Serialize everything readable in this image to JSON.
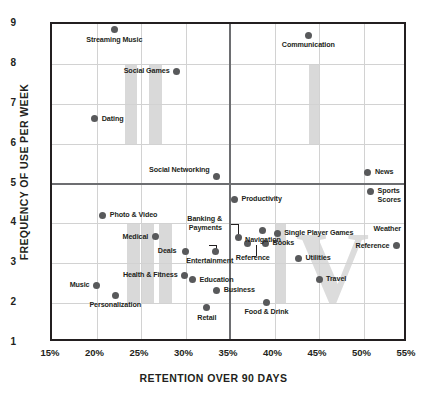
{
  "chart_data": {
    "type": "scatter",
    "title": "",
    "xlabel": "RETENTION OVER 90 DAYS",
    "ylabel": "FREQUENCY OF USE PER WEEK",
    "xlim": [
      15,
      55
    ],
    "ylim": [
      1,
      9
    ],
    "xticks": [
      "15%",
      "20%",
      "25%",
      "30%",
      "35%",
      "40%",
      "45%",
      "50%",
      "55%"
    ],
    "yticks": [
      "1",
      "2",
      "3",
      "4",
      "5",
      "6",
      "7",
      "8",
      "9"
    ],
    "grid": true,
    "legend": "none",
    "quadrant_divider_x": 35,
    "quadrant_divider_y": 5,
    "watermark": "IIII IV",
    "points": [
      {
        "label": "Streaming Music",
        "x": 22.0,
        "y": 8.85,
        "pos": "bc",
        "dx": 0,
        "dy": 6
      },
      {
        "label": "Social Games",
        "x": 29.0,
        "y": 7.82,
        "pos": "r",
        "dx": -7,
        "dy": 0
      },
      {
        "label": "Dating",
        "x": 19.8,
        "y": 6.62,
        "pos": "l",
        "dx": 7,
        "dy": 0
      },
      {
        "label": "Communication",
        "x": 43.8,
        "y": 8.72,
        "pos": "bc",
        "dx": 0,
        "dy": 6
      },
      {
        "label": "Social Networking",
        "x": 33.5,
        "y": 5.18,
        "pos": "r",
        "dx": -7,
        "dy": -6
      },
      {
        "label": "News",
        "x": 50.5,
        "y": 5.28,
        "pos": "l",
        "dx": 7,
        "dy": 0
      },
      {
        "label": "Productivity",
        "x": 35.5,
        "y": 4.6,
        "pos": "l",
        "dx": 7,
        "dy": 0
      },
      {
        "label": "Sports Scores",
        "x": 50.8,
        "y": 4.8,
        "pos": "l",
        "dx": 7,
        "dy": 4
      },
      {
        "label": "Photo & Video",
        "x": 20.7,
        "y": 4.2,
        "pos": "l",
        "dx": 7,
        "dy": 0
      },
      {
        "label": "Navigation",
        "x": 38.7,
        "y": 3.83,
        "pos": "bc",
        "dx": 0,
        "dy": 6
      },
      {
        "label": "Weather",
        "x": 55.0,
        "y": 3.7,
        "pos": "r",
        "dx": -7,
        "dy": -6
      },
      {
        "label": "Medical",
        "x": 26.6,
        "y": 3.66,
        "pos": "r",
        "dx": -7,
        "dy": 0
      },
      {
        "label": "Single Player Games",
        "x": 40.3,
        "y": 3.75,
        "pos": "l",
        "dx": 7,
        "dy": 0
      },
      {
        "label": "Banking & Payments",
        "x": 35.9,
        "y": 3.65,
        "pos": "r",
        "dx": -16,
        "dy": -14
      },
      {
        "label": "Deals",
        "x": 30.0,
        "y": 3.3,
        "pos": "r",
        "dx": -9,
        "dy": 0
      },
      {
        "label": "Entertainment",
        "x": 33.4,
        "y": 3.3,
        "pos": "bc",
        "dx": -6,
        "dy": 6
      },
      {
        "label": "Books",
        "x": 39.0,
        "y": 3.5,
        "pos": "l",
        "dx": 7,
        "dy": 0
      },
      {
        "label": "Reference",
        "x": 37.0,
        "y": 3.5,
        "pos": "bc",
        "dx": 5,
        "dy": 11
      },
      {
        "label": "Reference",
        "x": 53.7,
        "y": 3.44,
        "pos": "r",
        "dx": -7,
        "dy": 0
      },
      {
        "label": "Utilities",
        "x": 42.7,
        "y": 3.13,
        "pos": "l",
        "dx": 7,
        "dy": 0
      },
      {
        "label": "Health & Fitness",
        "x": 29.9,
        "y": 2.7,
        "pos": "r",
        "dx": -7,
        "dy": 0
      },
      {
        "label": "Education",
        "x": 30.8,
        "y": 2.58,
        "pos": "l",
        "dx": 7,
        "dy": 0
      },
      {
        "label": "Travel",
        "x": 45.0,
        "y": 2.6,
        "pos": "l",
        "dx": 7,
        "dy": 0
      },
      {
        "label": "Music",
        "x": 20.0,
        "y": 2.45,
        "pos": "r",
        "dx": -7,
        "dy": 0
      },
      {
        "label": "Business",
        "x": 33.5,
        "y": 2.32,
        "pos": "l",
        "dx": 7,
        "dy": 0
      },
      {
        "label": "Personalization",
        "x": 22.1,
        "y": 2.2,
        "pos": "bc",
        "dx": 0,
        "dy": 6
      },
      {
        "label": "Food & Drink",
        "x": 39.1,
        "y": 2.02,
        "pos": "bc",
        "dx": 0,
        "dy": 6
      },
      {
        "label": "Retail",
        "x": 32.4,
        "y": 1.88,
        "pos": "bc",
        "dx": 0,
        "dy": 6
      }
    ],
    "leaders": [
      {
        "x1": 35.1,
        "y1": 3.98,
        "x2": 35.9,
        "y2": 3.98,
        "x3": 35.9,
        "y3": 3.7
      },
      {
        "x1": 32.6,
        "y1": 3.45,
        "x2": 33.4,
        "y2": 3.45,
        "x3": 33.4,
        "y3": 3.33
      },
      {
        "x1": 37.5,
        "y1": 3.18,
        "x2": 37.9,
        "y2": 3.18,
        "x3": 37.9,
        "y3": 3.46
      }
    ],
    "watermark_bands": [
      {
        "x": 23.2,
        "y_top": 8.0,
        "y_bot": 6.0,
        "w": 1.4
      },
      {
        "x": 25.9,
        "y_top": 8.0,
        "y_bot": 6.0,
        "w": 1.5
      },
      {
        "x": 43.9,
        "y_top": 8.0,
        "y_bot": 6.0,
        "w": 1.2
      },
      {
        "x": 23.4,
        "y_top": 4.0,
        "y_bot": 2.0,
        "w": 1.5
      },
      {
        "x": 25.1,
        "y_top": 4.0,
        "y_bot": 2.0,
        "w": 1.4
      },
      {
        "x": 27.0,
        "y_top": 4.0,
        "y_bot": 2.0,
        "w": 1.5
      },
      {
        "x": 40.0,
        "y_top": 4.0,
        "y_bot": 2.0,
        "w": 1.3
      }
    ],
    "watermark_v": {
      "x": 45.3,
      "y_top": 4.0,
      "y_bot": 2.0
    }
  },
  "axes": {
    "x_title": "RETENTION OVER 90 DAYS",
    "y_title": "FREQUENCY OF USE PER WEEK"
  }
}
